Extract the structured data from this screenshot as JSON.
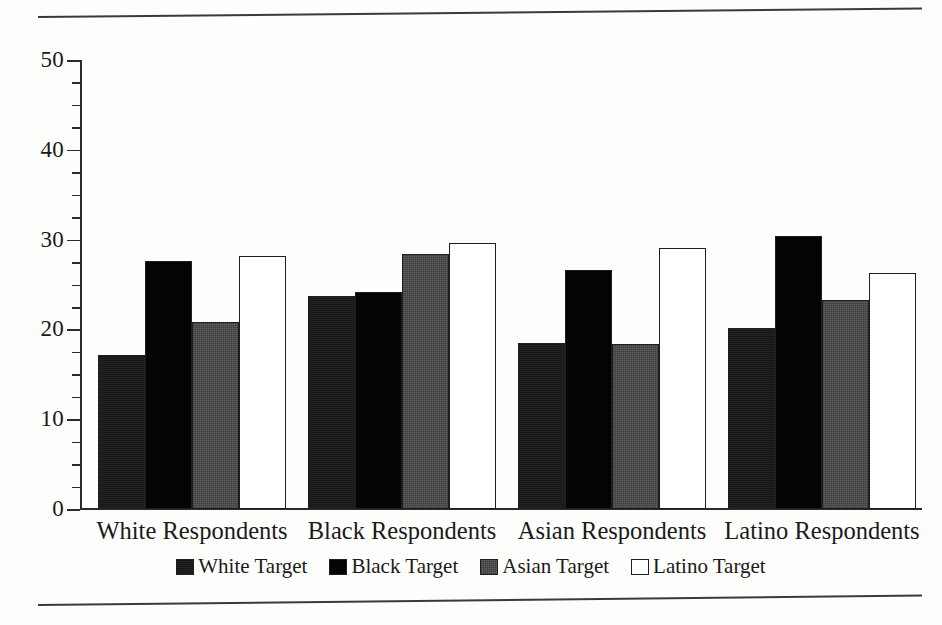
{
  "chart_data": {
    "type": "bar",
    "title": "",
    "xlabel": "",
    "ylabel": "",
    "ylim": [
      0,
      50
    ],
    "grid": false,
    "legend_position": "bottom-center",
    "categories": [
      "White Respondents",
      "Black Respondents",
      "Asian Respondents",
      "Latino Respondents"
    ],
    "y_ticks": [
      0,
      10,
      20,
      30,
      40,
      50
    ],
    "y_tick_labels": [
      "0",
      "10",
      "20",
      "30",
      "40",
      "50"
    ],
    "y_minor_tick_step": 2.5,
    "series": [
      {
        "name": "White Target",
        "fill": "solid-black",
        "values": [
          17.2,
          23.7,
          18.5,
          20.2
        ]
      },
      {
        "name": "Black Target",
        "fill": "dark-dither",
        "values": [
          27.6,
          24.2,
          26.6,
          30.4
        ]
      },
      {
        "name": "Asian Target",
        "fill": "medium-dither",
        "values": [
          20.8,
          28.4,
          18.4,
          23.3
        ]
      },
      {
        "name": "Latino Target",
        "fill": "white-outline",
        "values": [
          28.2,
          29.6,
          29.1,
          26.3
        ]
      }
    ]
  },
  "colors": {
    "axis": "#2b2b2b",
    "bar_outline": "#1f1f1f",
    "white_target": "#161616",
    "black_target": "#3f3f3f",
    "asian_target": "#a9a9a9",
    "latino_target": "#ffffff",
    "page_rule": "#3a3a3a",
    "background": "#fdfdfc"
  }
}
